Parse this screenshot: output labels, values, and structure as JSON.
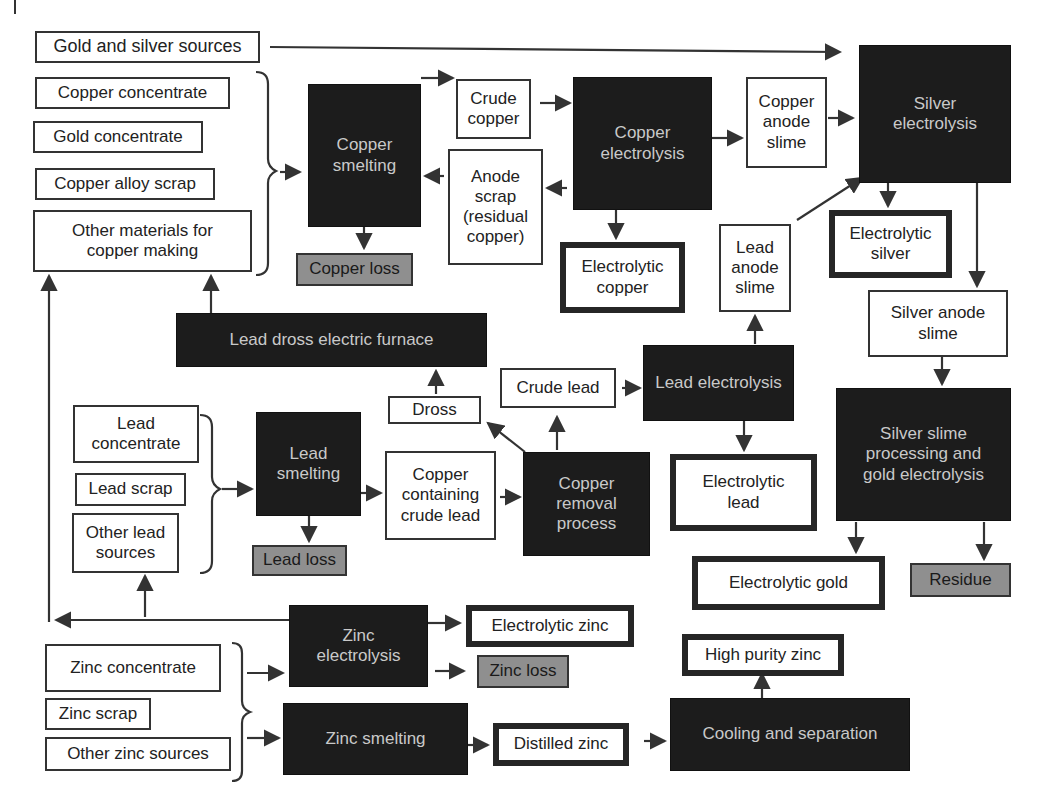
{
  "colors": {
    "process": "#1c1c1c",
    "process_text": "#c9c9c9",
    "loss": "#8f8f8f",
    "line": "#333333"
  },
  "nodes": {
    "gold_silver_sources": "Gold and silver sources",
    "copper_concentrate": "Copper concentrate",
    "gold_concentrate": "Gold concentrate",
    "copper_alloy_scrap": "Copper alloy scrap",
    "other_copper_materials": "Other materials for copper making",
    "copper_smelting": "Copper smelting",
    "copper_loss": "Copper loss",
    "crude_copper": "Crude copper",
    "anode_scrap": "Anode scrap (residual copper)",
    "copper_electrolysis": "Copper electrolysis",
    "electrolytic_copper": "Electrolytic copper",
    "copper_anode_slime": "Copper anode slime",
    "silver_electrolysis": "Silver electrolysis",
    "electrolytic_silver": "Electrolytic silver",
    "silver_anode_slime": "Silver anode slime",
    "lead_anode_slime": "Lead anode slime",
    "lead_dross_furnace": "Lead dross electric furnace",
    "dross": "Dross",
    "crude_lead": "Crude lead",
    "lead_electrolysis": "Lead electrolysis",
    "electrolytic_lead": "Electrolytic lead",
    "silver_slime_processing": "Silver slime processing and gold electrolysis",
    "electrolytic_gold": "Electrolytic gold",
    "residue": "Residue",
    "lead_concentrate": "Lead concentrate",
    "lead_scrap": "Lead scrap",
    "other_lead_sources": "Other lead sources",
    "lead_smelting": "Lead smelting",
    "lead_loss": "Lead loss",
    "copper_containing_crude_lead": "Copper containing crude lead",
    "copper_removal": "Copper removal process",
    "zinc_electrolysis": "Zinc electrolysis",
    "electrolytic_zinc": "Electrolytic zinc",
    "zinc_loss": "Zinc loss",
    "zinc_concentrate": "Zinc concentrate",
    "zinc_scrap": "Zinc scrap",
    "other_zinc_sources": "Other zinc sources",
    "zinc_smelting": "Zinc smelting",
    "distilled_zinc": "Distilled zinc",
    "cooling_separation": "Cooling and separation",
    "high_purity_zinc": "High purity zinc"
  },
  "legend": {
    "process": "black box = process step",
    "product": "thick border = final product",
    "loss": "gray box = loss / residue",
    "source": "thin border = raw material / intermediate"
  }
}
